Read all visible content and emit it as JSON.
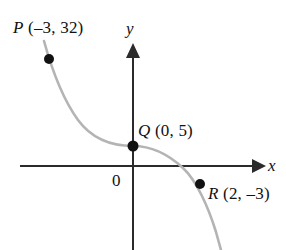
{
  "figure": {
    "type": "coordinate-plane-graph",
    "background_color": "#ffffff",
    "axes": {
      "x_axis": {
        "label": "x",
        "color": "#2b2b2b",
        "has_arrow": true,
        "arrow_direction": "right"
      },
      "y_axis": {
        "label": "y",
        "color": "#2b2b2b",
        "has_arrow": true,
        "arrow_direction": "up"
      },
      "origin_label": "0"
    },
    "curve": {
      "color": "#b4b4b4",
      "description": "decreasing S-shaped cubic curve"
    },
    "points": [
      {
        "name": "P",
        "coords": "(–3, 32)",
        "label": "P (–3, 32)",
        "x": -3,
        "y": 32
      },
      {
        "name": "Q",
        "coords": "(0, 5)",
        "label": "Q (0, 5)",
        "x": 0,
        "y": 5
      },
      {
        "name": "R",
        "coords": "(2, –3)",
        "label": "R (2, –3)",
        "x": 2,
        "y": -3
      }
    ]
  },
  "chart_data": {
    "type": "line",
    "title": "",
    "xlabel": "x",
    "ylabel": "y",
    "grid": false,
    "legend": null,
    "origin_label": "0",
    "series": [
      {
        "name": "cubic curve",
        "color": "#b4b4b4",
        "x": [
          -3,
          0,
          2
        ],
        "values": [
          32,
          5,
          -3
        ]
      }
    ],
    "annotations": [
      {
        "text": "P (–3, 32)",
        "x": -3,
        "y": 32
      },
      {
        "text": "Q (0, 5)",
        "x": 0,
        "y": 5
      },
      {
        "text": "R (2, –3)",
        "x": 2,
        "y": -3
      }
    ],
    "marked_points": [
      {
        "label": "P",
        "x": -3,
        "y": 32
      },
      {
        "label": "Q",
        "x": 0,
        "y": 5
      },
      {
        "label": "R",
        "x": 2,
        "y": -3
      }
    ]
  }
}
